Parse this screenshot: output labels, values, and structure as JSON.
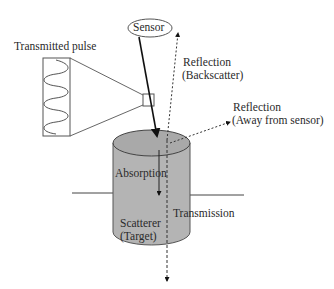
{
  "diagram": {
    "type": "radar scattering interactions",
    "labels": {
      "sensor": "Sensor",
      "transmitted_pulse": "Transmitted pulse",
      "reflection_backscatter_line1": "Reflection",
      "reflection_backscatter_line2": "(Backscatter)",
      "reflection_away_line1": "Reflection",
      "reflection_away_line2": "(Away from sensor)",
      "absorption": "Absorption",
      "transmission": "Transmission",
      "scatterer_line1": "Scatterer",
      "scatterer_line2": "(Target)"
    },
    "colors": {
      "cylinder_fill": "#b4b4b4",
      "cylinder_top": "#a8a8a8",
      "stroke": "#333333",
      "background": "#ffffff"
    },
    "nodes": [
      {
        "id": "sensor",
        "shape": "ellipse"
      },
      {
        "id": "transmitted-pulse",
        "shape": "rectangle-with-sine-wave"
      },
      {
        "id": "pulse-footprint",
        "shape": "small-rectangle"
      },
      {
        "id": "scatterer",
        "shape": "cylinder"
      },
      {
        "id": "ground-line",
        "shape": "line"
      }
    ],
    "edges": [
      {
        "from": "sensor",
        "to": "scatterer",
        "style": "solid-arrow",
        "meaning": "incident pulse"
      },
      {
        "from": "scatterer",
        "to": "sensor",
        "style": "dotted-arrow",
        "label": "Reflection (Backscatter)"
      },
      {
        "from": "scatterer",
        "to": "away",
        "style": "dotted-arrow",
        "label": "Reflection (Away from sensor)"
      },
      {
        "from": "scatterer-top",
        "to": "inside",
        "style": "solid-arrow",
        "label": "Absorption"
      },
      {
        "from": "scatterer",
        "to": "below",
        "style": "dashed-arrow",
        "label": "Transmission"
      }
    ]
  }
}
